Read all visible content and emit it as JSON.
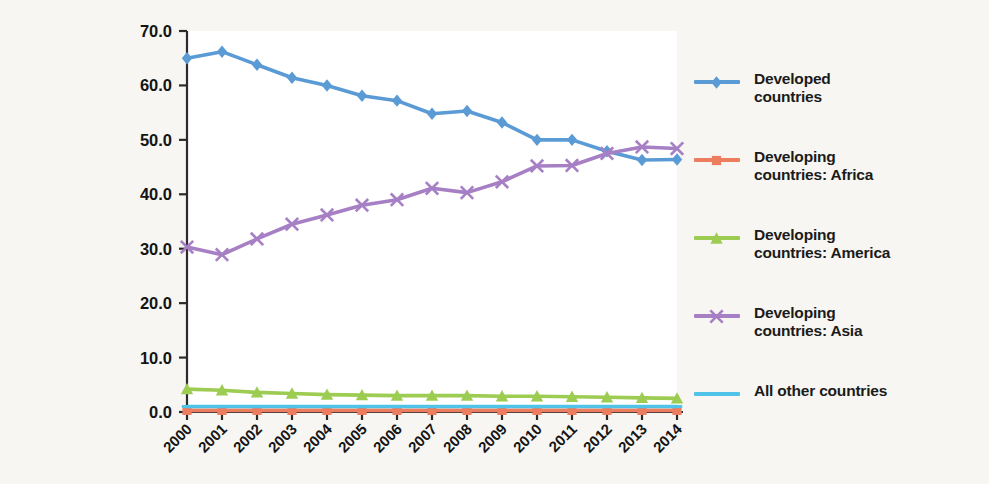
{
  "figure": {
    "background_color": "#f7f6f2",
    "plot_background_color": "#ffffff"
  },
  "chart_data": {
    "type": "line",
    "title": "",
    "subtitle": "",
    "xlabel": "",
    "ylabel": "",
    "grid": false,
    "legend_position": "right",
    "categories": [
      "2000",
      "2001",
      "2002",
      "2003",
      "2004",
      "2005",
      "2006",
      "2007",
      "2008",
      "2009",
      "2010",
      "2011",
      "2012",
      "2013",
      "2014"
    ],
    "x": [
      2000,
      2001,
      2002,
      2003,
      2004,
      2005,
      2006,
      2007,
      2008,
      2009,
      2010,
      2011,
      2012,
      2013,
      2014
    ],
    "xlim": [
      2000,
      2014
    ],
    "ylim": [
      0.0,
      70.0
    ],
    "yticks": [
      "0.0",
      "10.0",
      "20.0",
      "30.0",
      "40.0",
      "50.0",
      "60.0",
      "70.0"
    ],
    "ytick_values": [
      0.0,
      10.0,
      20.0,
      30.0,
      40.0,
      50.0,
      60.0,
      70.0
    ],
    "series": [
      {
        "name": "Developed countries",
        "color": "#5b9bd5",
        "marker": "diamond",
        "values": [
          65.0,
          66.2,
          63.8,
          61.4,
          60.0,
          58.1,
          57.2,
          54.8,
          55.3,
          53.2,
          50.0,
          50.0,
          47.9,
          46.3,
          46.4
        ]
      },
      {
        "name": "Developing countries: Africa",
        "color": "#ed7d5f",
        "marker": "square",
        "values": [
          0.3,
          0.3,
          0.3,
          0.3,
          0.3,
          0.3,
          0.3,
          0.3,
          0.3,
          0.3,
          0.3,
          0.3,
          0.3,
          0.3,
          0.3
        ]
      },
      {
        "name": "Developing countries: America",
        "color": "#9dcc52",
        "marker": "triangle",
        "values": [
          4.2,
          4.0,
          3.6,
          3.4,
          3.2,
          3.1,
          3.0,
          3.0,
          3.0,
          2.9,
          2.9,
          2.8,
          2.7,
          2.6,
          2.5
        ]
      },
      {
        "name": "Developing countries: Asia",
        "color": "#a67fc4",
        "marker": "cross",
        "values": [
          30.3,
          28.9,
          31.8,
          34.5,
          36.2,
          38.0,
          39.0,
          41.1,
          40.3,
          42.3,
          45.2,
          45.3,
          47.5,
          48.7,
          48.4
        ]
      },
      {
        "name": "All other countries",
        "color": "#4fc3e8",
        "marker": "line",
        "values": [
          1.0,
          1.0,
          1.0,
          1.0,
          1.0,
          1.0,
          1.0,
          1.0,
          1.0,
          1.0,
          1.0,
          1.0,
          1.0,
          1.0,
          1.0
        ]
      }
    ]
  },
  "legend": {
    "items": [
      {
        "label": "Developed\ncountries",
        "color": "#5b9bd5",
        "marker": "diamond"
      },
      {
        "label": "Developing\ncountries: Africa",
        "color": "#ed7d5f",
        "marker": "square"
      },
      {
        "label": "Developing\ncountries: America",
        "color": "#9dcc52",
        "marker": "triangle"
      },
      {
        "label": "Developing\ncountries: Asia",
        "color": "#a67fc4",
        "marker": "cross"
      },
      {
        "label": "All other countries",
        "color": "#4fc3e8",
        "marker": "line"
      }
    ]
  }
}
